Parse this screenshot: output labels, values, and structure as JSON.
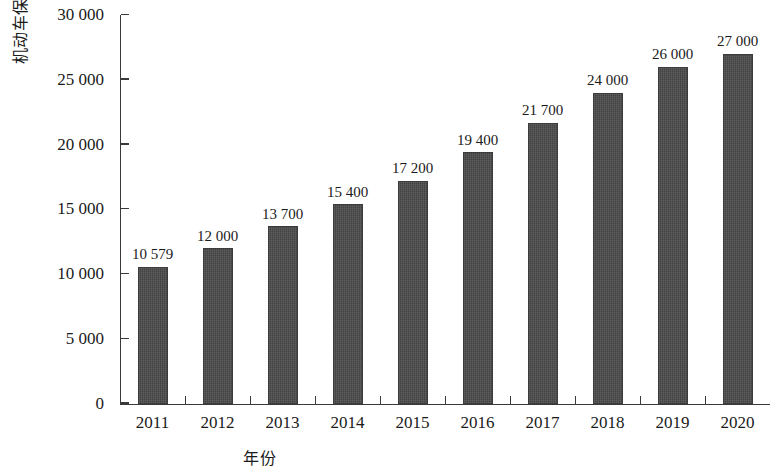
{
  "chart_data": {
    "type": "bar",
    "title": "",
    "xlabel": "年份",
    "ylabel": "机动车保有量/万辆",
    "categories": [
      "2011",
      "2012",
      "2013",
      "2014",
      "2015",
      "2016",
      "2017",
      "2018",
      "2019",
      "2020"
    ],
    "values": [
      10579,
      12000,
      13700,
      15400,
      17200,
      19400,
      21700,
      24000,
      26000,
      27000
    ],
    "value_labels": [
      "10 579",
      "12 000",
      "13 700",
      "15 400",
      "17 200",
      "19 400",
      "21 700",
      "24 000",
      "26 000",
      "27 000"
    ],
    "ylim": [
      0,
      30000
    ],
    "y_ticks": [
      0,
      5000,
      10000,
      15000,
      20000,
      25000,
      30000
    ],
    "y_tick_labels": [
      "0",
      "5 000",
      "10 000",
      "15 000",
      "20 000",
      "25 000",
      "30 000"
    ],
    "grid": false,
    "legend": false,
    "bar_color": "#4b4b4b",
    "axis_color": "#3a3a3a",
    "background_color": "#ffffff"
  }
}
